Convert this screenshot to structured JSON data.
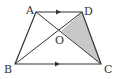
{
  "diagram": {
    "type": "trapezoid-with-diagonals",
    "points": {
      "A": {
        "label": "A",
        "x": 36,
        "y": 12
      },
      "D": {
        "label": "D",
        "x": 82,
        "y": 12
      },
      "B": {
        "label": "B",
        "x": 15,
        "y": 64
      },
      "C": {
        "label": "C",
        "x": 101,
        "y": 64
      },
      "O": {
        "label": "O",
        "x": 61,
        "y": 31
      }
    },
    "parallel_sides": [
      "AD",
      "BC"
    ],
    "shaded_region": [
      "O",
      "C",
      "D"
    ],
    "colors": {
      "stroke": "#333333",
      "shade": "#c8c8c8",
      "background": "#ffffff"
    }
  }
}
